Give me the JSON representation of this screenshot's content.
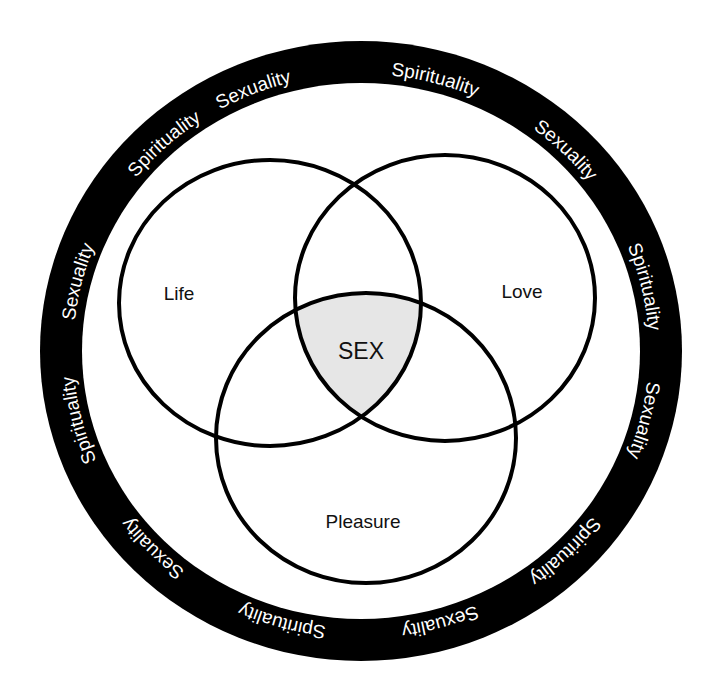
{
  "diagram": {
    "type": "venn",
    "ring": {
      "words": [
        {
          "text": "Spirituality",
          "angle": 15
        },
        {
          "text": "Sexuality",
          "angle": 45
        },
        {
          "text": "Spirituality",
          "angle": 77
        },
        {
          "text": "Sexuality",
          "angle": 104
        },
        {
          "text": "Spirituality",
          "angle": 135
        },
        {
          "text": "Sexuality",
          "angle": 164
        },
        {
          "text": "Spirituality",
          "angle": 196
        },
        {
          "text": "Sexuality",
          "angle": 226
        },
        {
          "text": "Spirituality",
          "angle": 256
        },
        {
          "text": "Sexuality",
          "angle": 284
        },
        {
          "text": "Spirituality",
          "angle": 317
        },
        {
          "text": "Sexuality",
          "angle": 338
        }
      ],
      "color": "#000000",
      "text_color": "#ffffff"
    },
    "circles": [
      {
        "label": "Life"
      },
      {
        "label": "Love"
      },
      {
        "label": "Pleasure"
      }
    ],
    "center_label": "SEX",
    "center_fill": "#e6e6e6"
  }
}
